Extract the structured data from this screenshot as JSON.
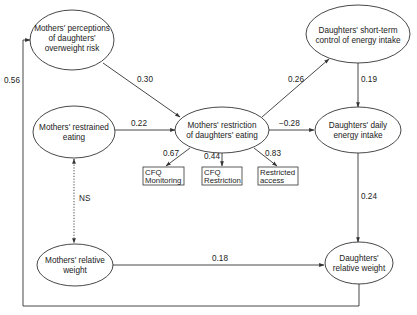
{
  "nodes": {
    "perceptions": {
      "lines": [
        "Mothers' perceptions",
        "of daughters'",
        "overweight risk"
      ]
    },
    "restrained": {
      "lines": [
        "Mothers' restrained",
        "eating"
      ]
    },
    "mothers_weight": {
      "lines": [
        "Mothers' relative",
        "weight"
      ]
    },
    "restriction": {
      "lines": [
        "Mothers' restriction",
        "of daughters' eating"
      ]
    },
    "short_term": {
      "lines": [
        "Daughters' short-term",
        "control of energy intake"
      ]
    },
    "daily_intake": {
      "lines": [
        "Daughters' daily",
        "energy intake"
      ]
    },
    "daughters_weight": {
      "lines": [
        "Daughters'",
        "relative weight"
      ]
    }
  },
  "indicators": {
    "cfq_monitoring": {
      "lines": [
        "CFQ",
        "Monitoring"
      ]
    },
    "cfq_restriction": {
      "lines": [
        "CFQ",
        "Restriction"
      ]
    },
    "restricted_access": {
      "lines": [
        "Restricted",
        "access"
      ]
    }
  },
  "edges": {
    "perceptions_to_restriction": "0.30",
    "restrained_to_restriction": "0.22",
    "restriction_to_short_term": "0.26",
    "restriction_to_daily_intake": "−0.28",
    "short_term_to_daily_intake": "0.19",
    "daily_intake_to_daughters_weight": "0.24",
    "mothers_weight_to_daughters_weight": "0.18",
    "daughters_weight_to_perceptions": "0.56",
    "restrained_mothers_weight_covariance": "NS",
    "restriction_to_cfq_monitoring": "0.67",
    "restriction_to_cfq_restriction": "0.44",
    "restriction_to_restricted_access": "0.83"
  }
}
